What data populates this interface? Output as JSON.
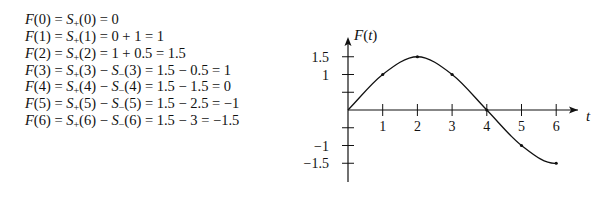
{
  "equations": [
    {
      "lhs": "F(0)",
      "parts": [
        "S+(0)"
      ],
      "rhs": "0",
      "text": "F(0) = S+(0) = 0"
    },
    {
      "lhs": "F(1)",
      "parts": [
        "S+(1)"
      ],
      "rhs": "0 + 1 = 1",
      "text": "F(1) = S+(1) = 0 + 1 = 1"
    },
    {
      "lhs": "F(2)",
      "parts": [
        "S+(2)"
      ],
      "rhs": "1 + 0.5 = 1.5",
      "text": "F(2) = S+(2) = 1 + 0.5 = 1.5"
    },
    {
      "lhs": "F(3)",
      "parts": [
        "S+(3)",
        "S-(3)"
      ],
      "rhs": "1.5 − 0.5 = 1",
      "text": "F(3) = S+(3) − S−(3) = 1.5 − 0.5 = 1"
    },
    {
      "lhs": "F(4)",
      "parts": [
        "S+(4)",
        "S-(4)"
      ],
      "rhs": "1.5 − 1.5 = 0",
      "text": "F(4) = S+(4) − S−(4) = 1.5 − 1.5 = 0"
    },
    {
      "lhs": "F(5)",
      "parts": [
        "S+(5)",
        "S-(5)"
      ],
      "rhs": "1.5 − 2.5 = −1",
      "text": "F(5) = S+(5) − S−(5) = 1.5 − 2.5 = −1"
    },
    {
      "lhs": "F(6)",
      "parts": [
        "S+(6)",
        "S-(6)"
      ],
      "rhs": "1.5 − 3 = −1.5",
      "text": "F(6) = S+(6) − S−(6) = 1.5 − 3 = −1.5"
    }
  ],
  "chart_data": {
    "type": "line",
    "title": "",
    "xlabel": "t",
    "ylabel": "F(t)",
    "x": [
      0,
      1,
      2,
      3,
      4,
      5,
      6
    ],
    "series": [
      {
        "name": "F(t)",
        "values": [
          0,
          1,
          1.5,
          1,
          0,
          -1,
          -1.5
        ]
      }
    ],
    "x_ticks": [
      "1",
      "2",
      "3",
      "4",
      "5",
      "6"
    ],
    "y_tick_labels": [
      "1.5",
      "1",
      "−1",
      "−1.5"
    ],
    "y_ticks": [
      1.5,
      1,
      0.5,
      -0.5,
      -1,
      -1.5
    ],
    "xlim": [
      0,
      6.7
    ],
    "ylim": [
      -2,
      2
    ],
    "grid": false,
    "legend": "none"
  }
}
